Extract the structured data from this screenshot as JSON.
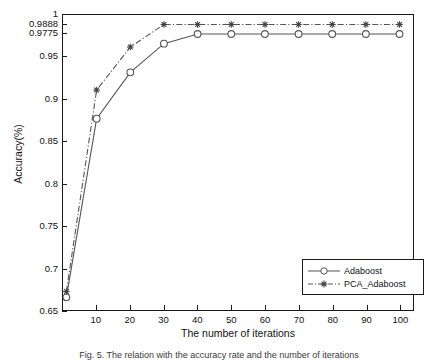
{
  "chart_data": {
    "type": "line",
    "title": "",
    "xlabel": "The number of iterations",
    "ylabel": "Accuracy(%)",
    "xlim": [
      0,
      104
    ],
    "ylim": [
      0.65,
      1.0
    ],
    "grid": false,
    "legend_position": "bottom-right",
    "xticks": [
      10,
      20,
      30,
      40,
      50,
      60,
      70,
      80,
      90,
      100
    ],
    "xtick_labels": [
      "10",
      "20",
      "30",
      "40",
      "50",
      "60",
      "70",
      "80",
      "90",
      "100"
    ],
    "yticks": [
      0.65,
      0.7,
      0.75,
      0.8,
      0.85,
      0.9,
      0.95,
      0.9775,
      0.9888,
      1
    ],
    "ytick_labels": [
      "0.65",
      "0.7",
      "0.75",
      "0.8",
      "0.85",
      "0.9",
      "0.95",
      "0.9775",
      "0.9888",
      "1"
    ],
    "x": [
      1,
      10,
      20,
      30,
      40,
      50,
      60,
      70,
      80,
      90,
      100
    ],
    "series": [
      {
        "name": "Adaboost",
        "marker": "open-circle",
        "linestyle": "solid",
        "color": "#555555",
        "values": [
          0.665,
          0.877,
          0.932,
          0.966,
          0.9775,
          0.9775,
          0.9775,
          0.9775,
          0.9775,
          0.9775,
          0.9775
        ]
      },
      {
        "name": "PCA_Adaboost",
        "marker": "filled-star",
        "linestyle": "dash-dot",
        "color": "#555555",
        "values": [
          0.672,
          0.911,
          0.962,
          0.9888,
          0.9888,
          0.9888,
          0.9888,
          0.9888,
          0.9888,
          0.9888,
          0.9888
        ]
      }
    ]
  },
  "legend": {
    "entries": [
      {
        "label": "Adaboost"
      },
      {
        "label": "PCA_Adaboost"
      }
    ]
  },
  "caption": {
    "text": "Fig. 5. The relation with the accuracy rate and the number of iterations"
  },
  "colors": {
    "axis": "#1a1a1a",
    "series_line": "#555555",
    "text": "#111111"
  }
}
